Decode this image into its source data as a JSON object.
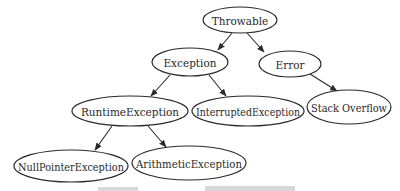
{
  "diagram": {
    "type": "tree",
    "nodes": [
      {
        "id": "throwable",
        "label": "Throwable",
        "cx": 240,
        "cy": 20,
        "rx": 37,
        "ry": 13
      },
      {
        "id": "exception",
        "label": "Exception",
        "cx": 190,
        "cy": 62,
        "rx": 38,
        "ry": 14
      },
      {
        "id": "error",
        "label": "Error",
        "cx": 290,
        "cy": 64,
        "rx": 31,
        "ry": 13
      },
      {
        "id": "runtime-exception",
        "label": "RuntimeException",
        "cx": 130,
        "cy": 111,
        "rx": 58,
        "ry": 15
      },
      {
        "id": "interrupted-exception",
        "label": "InterruptedException",
        "cx": 248,
        "cy": 111,
        "rx": 56,
        "ry": 15
      },
      {
        "id": "stack-overflow",
        "label": "Stack Overflow",
        "cx": 349,
        "cy": 107,
        "rx": 42,
        "ry": 17
      },
      {
        "id": "null-pointer-exception",
        "label": "NullPointerException",
        "cx": 71,
        "cy": 166,
        "rx": 57,
        "ry": 16
      },
      {
        "id": "arithmetic-exception",
        "label": "ArithmeticException",
        "cx": 189,
        "cy": 163,
        "rx": 57,
        "ry": 17
      }
    ],
    "edges": [
      {
        "from": "throwable",
        "to": "exception",
        "x1": 232,
        "y1": 33,
        "x2": 218,
        "y2": 50
      },
      {
        "from": "throwable",
        "to": "error",
        "x1": 247,
        "y1": 33,
        "x2": 264,
        "y2": 52
      },
      {
        "from": "exception",
        "to": "runtime-exception",
        "x1": 170,
        "y1": 75,
        "x2": 151,
        "y2": 96
      },
      {
        "from": "exception",
        "to": "interrupted-exception",
        "x1": 209,
        "y1": 75,
        "x2": 226,
        "y2": 96
      },
      {
        "from": "error",
        "to": "stack-overflow",
        "x1": 310,
        "y1": 74,
        "x2": 337,
        "y2": 91
      },
      {
        "from": "runtime-exception",
        "to": "null-pointer-exception",
        "x1": 112,
        "y1": 126,
        "x2": 95,
        "y2": 150
      },
      {
        "from": "runtime-exception",
        "to": "arithmetic-exception",
        "x1": 148,
        "y1": 126,
        "x2": 166,
        "y2": 147
      }
    ]
  },
  "colors": {
    "stroke": "#2a2a2a",
    "background": "#ffffff",
    "caption": "#d8d8d8"
  }
}
